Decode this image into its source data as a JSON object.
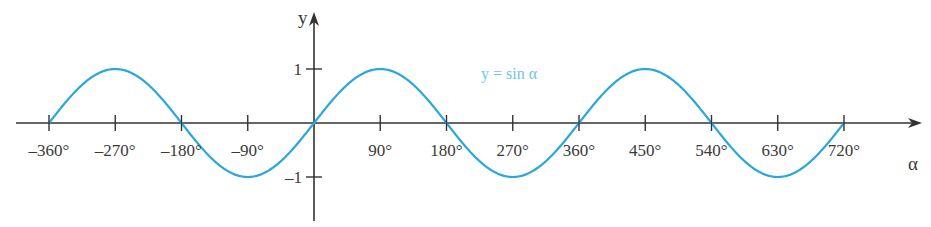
{
  "chart_data": {
    "type": "line",
    "title": "",
    "xlabel": "α",
    "ylabel": "y",
    "xlim": [
      -360,
      720
    ],
    "ylim": [
      -1,
      1
    ],
    "grid": false,
    "x_ticks": [
      -360,
      -270,
      -180,
      -90,
      90,
      180,
      270,
      360,
      450,
      540,
      630,
      720
    ],
    "x_tick_labels": [
      "–360°",
      "–270°",
      "–180°",
      "–90°",
      "90°",
      "180°",
      "270°",
      "360°",
      "450°",
      "540°",
      "630°",
      "720°"
    ],
    "y_ticks": [
      1,
      -1
    ],
    "y_tick_labels": [
      "1",
      "–1"
    ],
    "series": [
      {
        "name": "y = sin α",
        "function": "sin",
        "x": [
          -360,
          -270,
          -180,
          -90,
          0,
          90,
          180,
          270,
          360,
          450,
          540,
          630,
          720
        ],
        "values": [
          0,
          1,
          0,
          -1,
          0,
          1,
          0,
          -1,
          0,
          1,
          0,
          -1,
          0
        ],
        "color": "#2aa8dc"
      }
    ],
    "annotations": [
      {
        "text": "y = sin α",
        "x_deg": 230,
        "y": 0.85
      }
    ]
  },
  "colors": {
    "axis": "#333333",
    "curve": "#2aa8dc",
    "curve_label": "#6cc6e8",
    "text": "#3a3a3a"
  },
  "layout": {
    "origin_x": 314,
    "origin_y": 123,
    "px_per_deg": 0.7361,
    "px_per_unit_y": 54,
    "x_axis_start": 16,
    "x_axis_end": 922,
    "y_axis_top": 12,
    "y_axis_bottom": 221
  }
}
